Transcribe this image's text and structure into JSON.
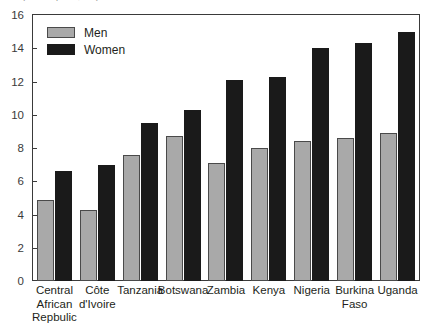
{
  "clipped_caption": "(deaths per 1,000)",
  "legend": {
    "position": "top-left inside plot",
    "entries": [
      {
        "label": "Men",
        "color": "#a9a9a9"
      },
      {
        "label": "Women",
        "color": "#1a1a1a"
      }
    ]
  },
  "chart_data": {
    "type": "bar",
    "title": "",
    "xlabel": "",
    "ylabel": "",
    "ylim": [
      0,
      16
    ],
    "yticks": [
      0,
      2,
      4,
      6,
      8,
      10,
      12,
      14,
      16
    ],
    "grid": false,
    "categories": [
      "Central African Repbulic",
      "Côte d'Ivoire",
      "Tanzania",
      "Botswana",
      "Zambia",
      "Kenya",
      "Nigeria",
      "Burkina Faso",
      "Uganda"
    ],
    "category_lines": [
      [
        "Central",
        "African",
        "Repbulic"
      ],
      [
        "Côte",
        "d'Ivoire"
      ],
      [
        "Tanzania"
      ],
      [
        "Botswana"
      ],
      [
        "Zambia"
      ],
      [
        "Kenya"
      ],
      [
        "Nigeria"
      ],
      [
        "Burkina",
        "Faso"
      ],
      [
        "Uganda"
      ]
    ],
    "series": [
      {
        "name": "Men",
        "color": "#a9a9a9",
        "values": [
          4.9,
          4.3,
          7.6,
          8.7,
          7.1,
          8.0,
          8.4,
          8.6,
          8.9
        ]
      },
      {
        "name": "Women",
        "color": "#1a1a1a",
        "values": [
          6.6,
          7.0,
          9.5,
          10.3,
          12.1,
          12.25,
          14.0,
          14.3,
          15.0
        ]
      }
    ]
  }
}
